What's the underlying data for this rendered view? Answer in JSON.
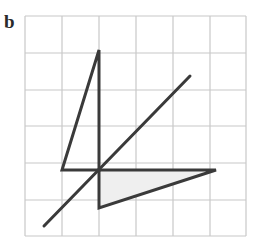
{
  "figure": {
    "label": "b",
    "grid": {
      "columns": 6,
      "rows": 6,
      "x_lines": [
        25,
        62,
        99,
        136,
        173,
        210,
        246
      ],
      "y_lines": [
        16,
        53,
        90,
        126,
        163,
        200,
        236
      ],
      "line_color": "#c8c8c8"
    },
    "shapes": {
      "stroke_color": "#3a3a3a",
      "shade_color": "#efefef",
      "object_triangle": {
        "points": [
          [
            99,
            50
          ],
          [
            62,
            170
          ],
          [
            99,
            170
          ]
        ],
        "filled": false
      },
      "image_triangle": {
        "points": [
          [
            99,
            170
          ],
          [
            216,
            170
          ],
          [
            99,
            208
          ]
        ],
        "filled": true
      },
      "mirror_line": {
        "from": [
          44,
          226
        ],
        "to": [
          190,
          76
        ]
      }
    }
  }
}
